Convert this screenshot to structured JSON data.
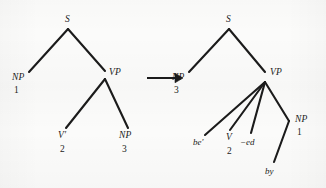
{
  "figure": {
    "background_color": "#fbfbfa",
    "ink_color": "#1b1b1b"
  },
  "arrow": {
    "name": "rewrite-arrow",
    "glyph": "→",
    "direction": "right"
  },
  "left_tree": {
    "name": "deep-structure-tree",
    "nodes": [
      {
        "id": "S",
        "label": "S",
        "index": "",
        "x": 68,
        "y": 22
      },
      {
        "id": "NP1",
        "label": "NP",
        "index": "1",
        "x": 18,
        "y": 78
      },
      {
        "id": "VP",
        "label": "VP",
        "index": "",
        "x": 110,
        "y": 74
      },
      {
        "id": "V2",
        "label": "V′",
        "index": "2",
        "x": 59,
        "y": 137
      },
      {
        "id": "NP3",
        "label": "NP",
        "index": "3",
        "x": 119,
        "y": 137
      }
    ],
    "edges": [
      {
        "from": "S",
        "to": "NP1"
      },
      {
        "from": "S",
        "to": "VP"
      },
      {
        "from": "VP",
        "to": "V2"
      },
      {
        "from": "VP",
        "to": "NP3"
      }
    ]
  },
  "right_tree": {
    "name": "surface-structure-tree",
    "nodes": [
      {
        "id": "S",
        "label": "S",
        "index": "",
        "x": 229,
        "y": 22
      },
      {
        "id": "NP3",
        "label": "NP",
        "index": "3",
        "x": 178,
        "y": 78
      },
      {
        "id": "VP",
        "label": "VP",
        "index": "",
        "x": 270,
        "y": 74
      },
      {
        "id": "be",
        "label": "be′",
        "index": "",
        "x": 196,
        "y": 142
      },
      {
        "id": "V2",
        "label": "V",
        "index": "2",
        "x": 227,
        "y": 137
      },
      {
        "id": "ed",
        "label": "−ed",
        "index": "",
        "x": 244,
        "y": 142
      },
      {
        "id": "NP1",
        "label": "NP",
        "index": "1",
        "x": 297,
        "y": 119
      },
      {
        "id": "by",
        "label": "by",
        "index": "",
        "x": 267,
        "y": 170
      }
    ],
    "edges": [
      {
        "from": "S",
        "to": "NP3"
      },
      {
        "from": "S",
        "to": "VP"
      },
      {
        "from": "VP",
        "to": "be"
      },
      {
        "from": "VP",
        "to": "V2"
      },
      {
        "from": "VP",
        "to": "ed"
      },
      {
        "from": "VP",
        "to": "NP1"
      },
      {
        "from": "NP1",
        "to": "by"
      }
    ]
  },
  "labels": {
    "left": {
      "s": "S",
      "np_subject": "NP",
      "np_subject_index": "1",
      "vp": "VP",
      "v_bar": "V′",
      "v_bar_index": "2",
      "np_object": "NP",
      "np_object_index": "3"
    },
    "right": {
      "s": "S",
      "np_subject": "NP",
      "np_subject_index": "3",
      "vp": "VP",
      "be": "be′",
      "v": "V",
      "v_index": "2",
      "ed": "−ed",
      "np_oblique": "NP",
      "np_oblique_index": "1",
      "by": "by"
    },
    "arrow": "→"
  }
}
